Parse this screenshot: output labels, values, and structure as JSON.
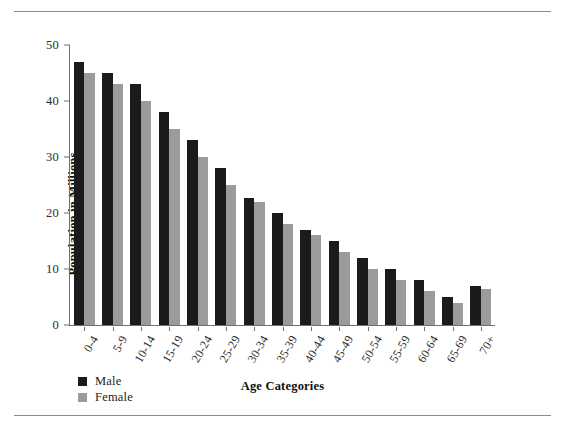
{
  "chart_data": {
    "type": "bar",
    "title": "",
    "xlabel": "Age Categories",
    "ylabel": "Population in Millions",
    "categories": [
      "0-4",
      "5-9",
      "10-14",
      "15-19",
      "20-24",
      "25-29",
      "30-34",
      "35-39",
      "40-44",
      "45-49",
      "50-54",
      "55-59",
      "60-64",
      "65-69",
      "70+"
    ],
    "series": [
      {
        "name": "Male",
        "color": "#1b1b1b",
        "values": [
          47,
          45,
          43,
          38,
          33,
          28,
          22.7,
          20,
          17,
          15,
          12,
          10,
          8,
          5,
          7
        ]
      },
      {
        "name": "Female",
        "color": "#9b9b9b",
        "values": [
          45,
          43,
          40,
          35,
          30,
          25,
          22,
          18,
          16,
          13,
          10,
          8,
          6,
          4,
          6.5
        ]
      }
    ],
    "ylim": [
      0,
      50
    ],
    "yticks": [
      0,
      10,
      20,
      30,
      40,
      50
    ],
    "ytick_labels": [
      "0",
      "10",
      "20",
      "30",
      "40",
      "50"
    ],
    "grid": false,
    "legend_position": "bottom-left",
    "legend_entries": [
      "Male",
      "Female"
    ]
  },
  "figure": {
    "top_rule": "horizontal-rule",
    "bottom_rule": "horizontal-rule"
  }
}
